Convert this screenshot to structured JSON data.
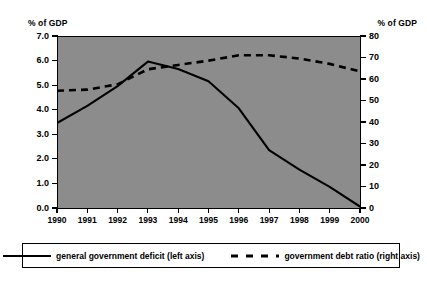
{
  "axis_unit_left": "% of GDP",
  "axis_unit_right": "% of GDP",
  "legend": {
    "deficit_label": "general government deficit (left axis)",
    "debt_label": "government debt ratio (right axis)"
  },
  "colors": {
    "plot_background": "#8c8c8c",
    "page_background": "#ffffff",
    "line": "#000000",
    "axis": "#000000"
  },
  "chart_data": {
    "type": "line",
    "title": "",
    "subtitle": "",
    "xlabel": "",
    "ylabel": "% of GDP",
    "ylabel_right": "% of GDP",
    "grid": false,
    "legend_position": "bottom",
    "categories": [
      "1990",
      "1991",
      "1992",
      "1993",
      "1994",
      "1995",
      "1996",
      "1997",
      "1998",
      "1999",
      "2000"
    ],
    "x": [
      1990,
      1991,
      1992,
      1993,
      1994,
      1995,
      1996,
      1997,
      1998,
      1999,
      2000
    ],
    "ylim": [
      0.0,
      7.0
    ],
    "ylim_right": [
      0,
      80
    ],
    "yticks": [
      "0.0",
      "1.0",
      "2.0",
      "3.0",
      "4.0",
      "5.0",
      "6.0",
      "7.0"
    ],
    "ytick_values": [
      0.0,
      1.0,
      2.0,
      3.0,
      4.0,
      5.0,
      6.0,
      7.0
    ],
    "yticks_right": [
      "0",
      "10",
      "20",
      "30",
      "40",
      "50",
      "60",
      "70",
      "80"
    ],
    "ytick_values_right": [
      0,
      10,
      20,
      30,
      40,
      50,
      60,
      70,
      80
    ],
    "series": [
      {
        "name": "general government deficit (left axis)",
        "axis": "left",
        "style": "solid",
        "color": "#000000",
        "values": [
          3.5,
          4.2,
          5.0,
          6.0,
          5.7,
          5.2,
          4.1,
          2.4,
          1.6,
          0.9,
          0.1
        ]
      },
      {
        "name": "government debt ratio (right axis)",
        "axis": "right",
        "style": "dashed",
        "color": "#000000",
        "values": [
          55,
          55.5,
          58,
          65,
          67,
          69,
          71.5,
          71.5,
          70,
          67.5,
          64
        ]
      }
    ]
  }
}
